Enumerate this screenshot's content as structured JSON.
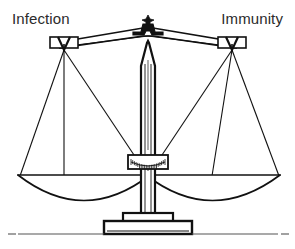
{
  "figure": {
    "name": "balance-scale-illustration",
    "type": "line-art-diagram",
    "width": 295,
    "height": 249,
    "background_color": "#ffffff",
    "line_color": "#111111",
    "text_color": "#2b2b2b"
  },
  "labels": {
    "left": "Infection",
    "right": "Immunity"
  },
  "parts": {
    "beam": "balance-beam",
    "finial": "pivot-finial",
    "column": "center-column",
    "gauge": "graduated-scale-plate",
    "base": "stepped-base",
    "ground": "ground-line",
    "left_pan": "left-pan",
    "right_pan": "right-pan",
    "left_hanger": "left-hanger-block",
    "right_hanger": "right-hanger-block"
  },
  "geometry": {
    "beam_center_x": 148,
    "beam_top_y": 30,
    "left_hanger_x": 62,
    "right_hanger_x": 234,
    "hanger_y": 45,
    "left_pan_center_x": 84,
    "right_pan_center_x": 212,
    "pan_rim_y": 174,
    "pan_bottom_y": 212,
    "left_pan_rim_left": 18,
    "left_pan_rim_right": 150,
    "right_pan_rim_left": 146,
    "right_pan_rim_right": 280,
    "gauge_y": 155,
    "base_top_y": 214,
    "ground_y": 234
  },
  "tick_count": 21
}
